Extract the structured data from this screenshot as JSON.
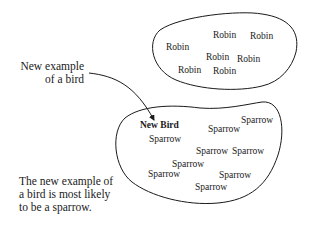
{
  "diagram": {
    "type": "classification-illustration",
    "callout_label": [
      "New example",
      "of a bird"
    ],
    "conclusion": [
      "The new example of",
      "a bird is most likely",
      "to be a sparrow."
    ],
    "clusters": [
      {
        "name": "robin-cluster",
        "items": [
          "Robin",
          "Robin",
          "Robin",
          "Robin",
          "Robin",
          "Robin",
          "Robin"
        ]
      },
      {
        "name": "sparrow-cluster",
        "new_item": "New Bird",
        "items": [
          "Sparrow",
          "Sparrow",
          "Sparrow",
          "Sparrow",
          "Sparrow",
          "Sparrow",
          "Sparrow",
          "Sparrow",
          "Sparrow"
        ]
      }
    ],
    "colors": {
      "ink": "#1a1a1a",
      "background": "#ffffff"
    }
  }
}
